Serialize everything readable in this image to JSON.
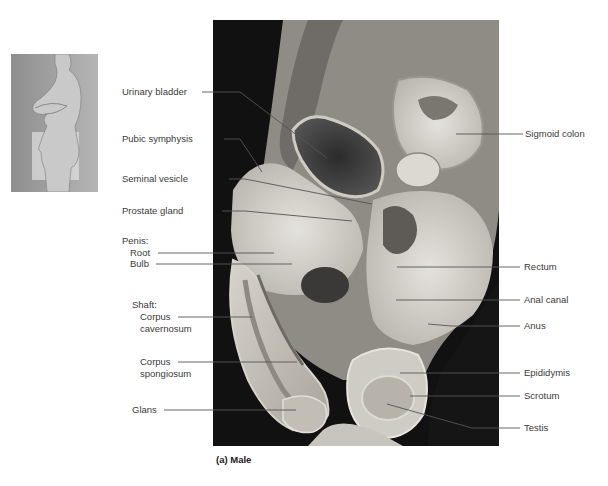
{
  "figure": {
    "caption": "(a) Male",
    "thumbnail_alt": "Side-view photo of standing male with pelvic region highlighted",
    "photo_alt": "Median section of male pelvic cavity (cadaver dissection)"
  },
  "labels_left": {
    "urinary_bladder": "Urinary bladder",
    "pubic_symphysis": "Pubic symphysis",
    "seminal_vesicle": "Seminal vesicle",
    "prostate_gland": "Prostate gland",
    "penis_heading": "Penis:",
    "root": "Root",
    "bulb": "Bulb",
    "shaft_heading": "Shaft:",
    "corpus_cavernosum_1": "Corpus",
    "corpus_cavernosum_2": "cavernosum",
    "corpus_spongiosum_1": "Corpus",
    "corpus_spongiosum_2": "spongiosum",
    "glans": "Glans"
  },
  "labels_right": {
    "sigmoid_colon": "Sigmoid colon",
    "rectum": "Rectum",
    "anal_canal": "Anal canal",
    "anus": "Anus",
    "epididymis": "Epididymis",
    "scrotum": "Scrotum",
    "testis": "Testis"
  },
  "colors": {
    "leader_line": "#555555",
    "text": "#3a3a3a",
    "photo_background": "#111111"
  }
}
